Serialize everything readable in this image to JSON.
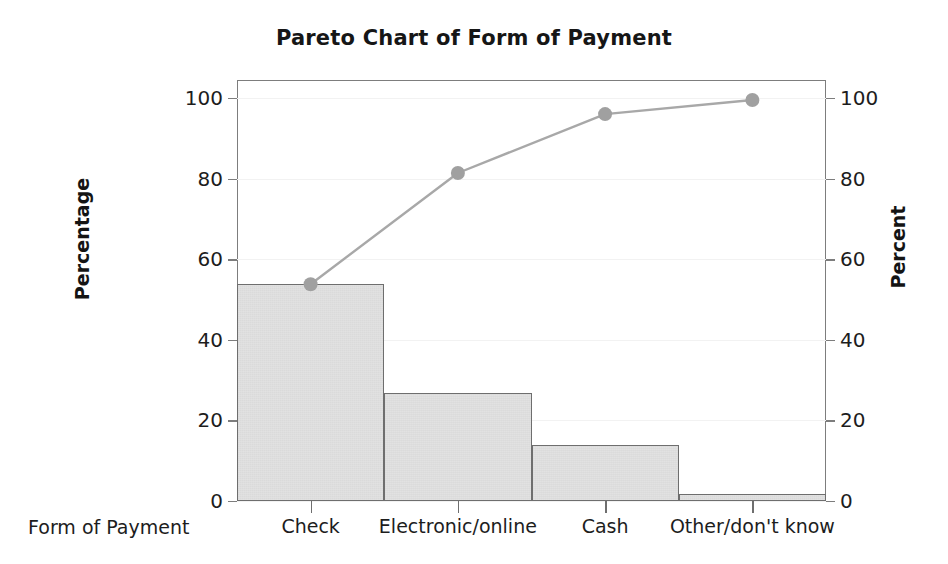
{
  "chart_data": {
    "type": "bar",
    "title": "Pareto Chart of Form of Payment",
    "xlabel": "Form of Payment",
    "ylabel": "Percentage",
    "y2label": "Percent",
    "categories": [
      "Check",
      "Electronic/online",
      "Cash",
      "Other/don't know"
    ],
    "values": [
      53.8,
      26.8,
      13.9,
      1.7
    ],
    "series": [
      {
        "name": "Percentage",
        "type": "bar",
        "values": [
          53.8,
          26.8,
          13.9,
          1.7
        ]
      },
      {
        "name": "Cumulative Percent",
        "type": "line",
        "values": [
          53.8,
          81.4,
          96.0,
          99.5
        ]
      }
    ],
    "ylim": [
      0,
      100
    ],
    "y2lim": [
      0,
      100
    ],
    "yticks": [
      0,
      20,
      40,
      60,
      80,
      100
    ],
    "y2ticks": [
      0,
      20,
      40,
      60,
      80,
      100
    ],
    "ytick_labels": [
      "0",
      "20",
      "40",
      "60",
      "80",
      "100"
    ],
    "y2tick_labels": [
      "0",
      "20",
      "40",
      "60",
      "80",
      "100"
    ],
    "grid": true,
    "legend": false,
    "bar_color": "#d9d9d9",
    "bar_edge_color": "#6e6e6e",
    "line_color": "#a8a8a8",
    "marker_color": "#a0a0a0",
    "frame_color": "#7d7d7d",
    "grid_color": "#f2f2f2",
    "text_color": "#1d1d1d"
  }
}
